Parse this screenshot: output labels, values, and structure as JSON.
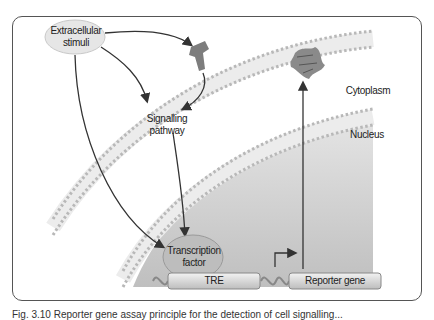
{
  "figure": {
    "labels": {
      "extracellular": "Extracellular stimuli",
      "signalling": "Signalling pathway",
      "transcription_factor": "Transcription factor",
      "tre": "TRE",
      "reporter_gene": "Reporter gene",
      "cytoplasm": "Cytoplasm",
      "nucleus": "Nucleus"
    },
    "caption": "Fig. 3.10 Reporter gene assay principle for the detection of cell signalling..."
  },
  "colors": {
    "membrane_dot": "#b8b8b8",
    "receptor": "#7d7d7d",
    "oval_fill": "#e6e6e6",
    "tf_fill": "#bdbdbd",
    "nucleus_fill": "#cfcfcf",
    "arrow": "#333333"
  }
}
